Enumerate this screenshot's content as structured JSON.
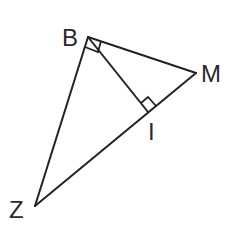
{
  "diagram": {
    "type": "geometry",
    "points": {
      "B": {
        "label": "B",
        "x": 88,
        "y": 37
      },
      "M": {
        "label": "M",
        "x": 196,
        "y": 73
      },
      "I": {
        "label": "I",
        "x": 148,
        "y": 112
      },
      "Z": {
        "label": "Z",
        "x": 35,
        "y": 206
      }
    },
    "segments": [
      {
        "from": "B",
        "to": "M"
      },
      {
        "from": "B",
        "to": "Z"
      },
      {
        "from": "Z",
        "to": "M"
      },
      {
        "from": "B",
        "to": "I"
      }
    ],
    "right_angles": [
      {
        "vertex": "B",
        "between": [
          "Z",
          "M"
        ]
      },
      {
        "vertex": "I",
        "between": [
          "B",
          "M"
        ]
      }
    ],
    "labels": {
      "B": "B",
      "M": "M",
      "I": "I",
      "Z": "Z"
    }
  }
}
